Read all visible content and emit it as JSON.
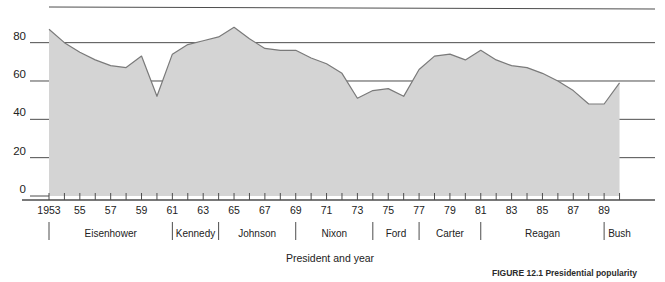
{
  "chart_data": {
    "type": "area",
    "title": "",
    "xlabel": "President and year",
    "ylabel": "",
    "ylim": [
      0,
      100
    ],
    "yticks": [
      0,
      20,
      40,
      60,
      80
    ],
    "grid": true,
    "legend": false,
    "x": [
      1953,
      1954,
      1955,
      1956,
      1957,
      1958,
      1959,
      1960,
      1961,
      1962,
      1963,
      1964,
      1965,
      1966,
      1967,
      1968,
      1969,
      1970,
      1971,
      1972,
      1973,
      1974,
      1975,
      1976,
      1977,
      1978,
      1979,
      1980,
      1981,
      1982,
      1983,
      1984,
      1985,
      1986,
      1987,
      1988,
      1989,
      1990
    ],
    "values": [
      87,
      80,
      75,
      71,
      68,
      67,
      73,
      52,
      74,
      79,
      81,
      83,
      88,
      82,
      77,
      76,
      76,
      72,
      69,
      64,
      51,
      55,
      56,
      52,
      66,
      73,
      74,
      71,
      76,
      71,
      68,
      67,
      64,
      60,
      55,
      48,
      48,
      59
    ],
    "xtick_labels": [
      "1953",
      "55",
      "57",
      "59",
      "61",
      "63",
      "65",
      "67",
      "69",
      "71",
      "73",
      "75",
      "77",
      "79",
      "81",
      "83",
      "85",
      "87",
      "89"
    ],
    "xtick_years": [
      1953,
      1955,
      1957,
      1959,
      1961,
      1963,
      1965,
      1967,
      1969,
      1971,
      1973,
      1975,
      1977,
      1979,
      1981,
      1983,
      1985,
      1987,
      1989
    ],
    "presidents": [
      {
        "name": "Eisenhower",
        "start_year": 1953,
        "end_year": 1961
      },
      {
        "name": "Kennedy",
        "start_year": 1961,
        "end_year": 1964
      },
      {
        "name": "Johnson",
        "start_year": 1964,
        "end_year": 1969
      },
      {
        "name": "Nixon",
        "start_year": 1969,
        "end_year": 1974
      },
      {
        "name": "Ford",
        "start_year": 1974,
        "end_year": 1977
      },
      {
        "name": "Carter",
        "start_year": 1977,
        "end_year": 1981
      },
      {
        "name": "Reagan",
        "start_year": 1981,
        "end_year": 1989
      },
      {
        "name": "Bush",
        "start_year": 1989,
        "end_year": 1991
      }
    ],
    "colors": {
      "area_fill": "#d4d4d4",
      "line": "#7a7a7a",
      "grid": "#4d4d4d",
      "axis": "#4d4d4d",
      "text": "#222222"
    }
  },
  "axis": {
    "x_title": "President and year",
    "y_tick_labels": [
      "80",
      "60",
      "40",
      "20",
      "0"
    ]
  },
  "caption": {
    "text": "FIGURE 12.1 Presidential popularity"
  }
}
